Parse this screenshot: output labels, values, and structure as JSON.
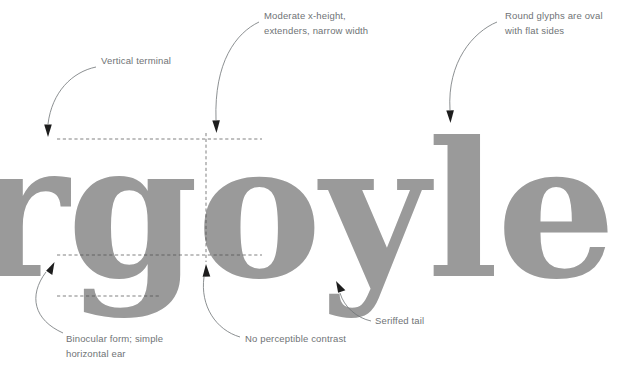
{
  "page": {
    "background_color": "#ffffff",
    "width": 637,
    "height": 373
  },
  "specimen": {
    "text": "rgoyle",
    "color": "#9a9a9a",
    "description": "Large slab-serif type specimen showing the partial word 'rgoyle', cropped at both edges"
  },
  "annotations": [
    {
      "id": "vertical-terminal",
      "label": "Vertical terminal",
      "lines": [
        "Vertical terminal"
      ],
      "target": "r terminal"
    },
    {
      "id": "x-height",
      "label": "Moderate x-height, extenders, narrow width",
      "lines": [
        "Moderate x-height,",
        "extenders, narrow width"
      ],
      "target": "o x-height line"
    },
    {
      "id": "round-glyphs",
      "label": "Round glyphs are oval with flat sides",
      "lines": [
        "Round glyphs are oval",
        "with flat sides"
      ],
      "target": "e bowl"
    },
    {
      "id": "binocular-form",
      "label": "Binocular form; simple horizontal ear",
      "lines": [
        "Binocular form; simple",
        "horizontal ear"
      ],
      "target": "g ear"
    },
    {
      "id": "no-contrast",
      "label": "No perceptible contrast",
      "lines": [
        "No perceptible contrast"
      ],
      "target": "o stem base"
    },
    {
      "id": "seriffed-tail",
      "label": "Seriffed tail",
      "lines": [
        "Seriffed tail"
      ],
      "target": "y descender tail"
    }
  ],
  "guides": {
    "stroke_color": "#4a4a4a",
    "style": "dashed",
    "items": [
      {
        "name": "x-height-line",
        "orientation": "horizontal"
      },
      {
        "name": "baseline",
        "orientation": "horizontal"
      },
      {
        "name": "descender-line",
        "orientation": "horizontal"
      },
      {
        "name": "o-vertical-axis",
        "orientation": "vertical"
      }
    ]
  },
  "colors": {
    "glyph_gray": "#9a9a9a",
    "annotation_text": "#6f7376",
    "leader_line": "#6f7376",
    "arrowhead": "#1d1d1d",
    "guide_line": "#4a4a4a"
  }
}
